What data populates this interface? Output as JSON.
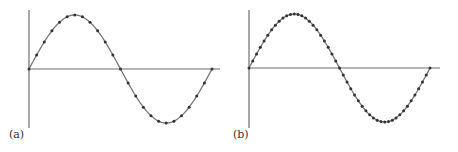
{
  "colors": {
    "axis": "#6e6e6e",
    "curve": "#777777",
    "dot": "#333333"
  },
  "chart_data": [
    {
      "type": "line",
      "panel_label": "(a)",
      "title": "",
      "xlabel": "",
      "ylabel": "",
      "function": "sine",
      "periods": 1,
      "samples_per_period": 24,
      "markers": true,
      "x": [
        0,
        0.0417,
        0.0833,
        0.125,
        0.1667,
        0.2083,
        0.25,
        0.2917,
        0.3333,
        0.375,
        0.4167,
        0.4583,
        0.5,
        0.5417,
        0.5833,
        0.625,
        0.6667,
        0.7083,
        0.75,
        0.7917,
        0.8333,
        0.875,
        0.9167,
        0.9583,
        1
      ],
      "y": [
        0,
        0.259,
        0.5,
        0.707,
        0.866,
        0.966,
        1,
        0.966,
        0.866,
        0.707,
        0.5,
        0.259,
        0,
        -0.259,
        -0.5,
        -0.707,
        -0.866,
        -0.966,
        -1,
        -0.966,
        -0.866,
        -0.707,
        -0.5,
        -0.259,
        0
      ],
      "geom": {
        "ox": 29,
        "oy": 69,
        "width": 183,
        "amp": 54,
        "ytop": 10,
        "ybot": 128,
        "xend": 220
      },
      "grid": false,
      "legend": null
    },
    {
      "type": "line",
      "panel_label": "(b)",
      "title": "",
      "xlabel": "",
      "ylabel": "",
      "function": "sine",
      "periods": 1,
      "samples_per_period": 48,
      "markers": true,
      "x": "48 uniformly spaced samples over one period [0,1]",
      "y": "sin(2*pi*x) at each sample",
      "geom": {
        "ox": 20,
        "oy": 68,
        "width": 181,
        "amp": 54,
        "ytop": 10,
        "ybot": 128,
        "xend": 211
      },
      "grid": false,
      "legend": null
    }
  ]
}
